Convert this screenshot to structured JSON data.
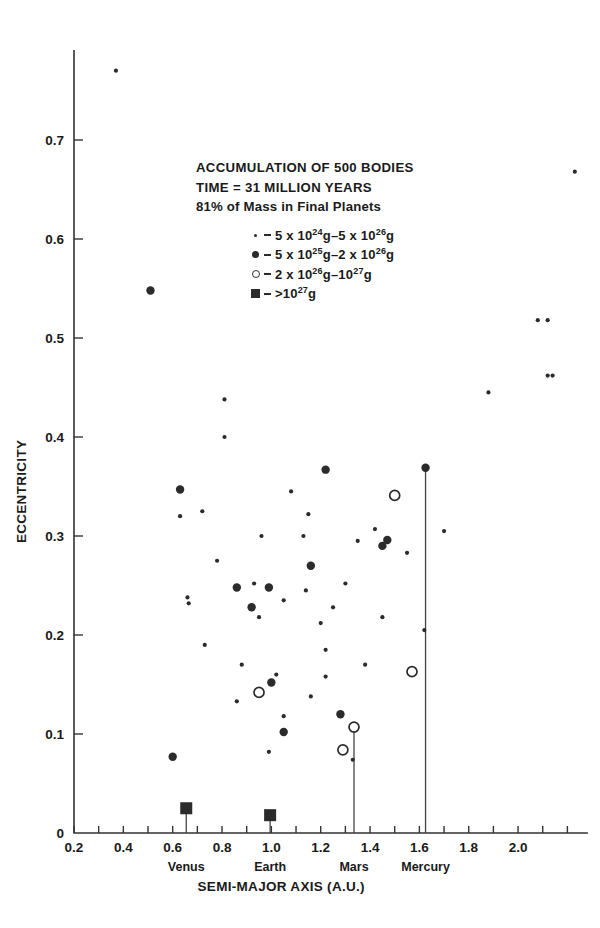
{
  "figure": {
    "annotation": {
      "line1": "ACCUMULATION OF 500 BODIES",
      "line2": "TIME = 31 MILLION YEARS",
      "line3": "81% of Mass in Final Planets"
    },
    "legend": [
      {
        "marker": "tiny-dot",
        "prefix": "5 x 10",
        "exp1": "24",
        "mid": "g–5 x 10",
        "exp2": "26",
        "suffix": "g",
        "text": "5 x 10^24 g–5 x 10^26 g"
      },
      {
        "marker": "dot",
        "prefix": "5 x 10",
        "exp1": "25",
        "mid": "g–2 x 10",
        "exp2": "26",
        "suffix": "g",
        "text": "5 x 10^25 g–2 x 10^26 g"
      },
      {
        "marker": "open-circle",
        "prefix": "2 x 10",
        "exp1": "26",
        "mid": "g–10",
        "exp2": "27",
        "suffix": "g",
        "text": "2 x 10^26 g–10^27 g"
      },
      {
        "marker": "filled-square",
        "prefix": ">10",
        "exp1": "27",
        "mid": "",
        "exp2": "",
        "suffix": "g",
        "text": ">10^27 g"
      }
    ]
  },
  "chart_data": {
    "type": "scatter",
    "title": "ACCUMULATION OF 500 BODIES",
    "xlabel": "SEMI-MAJOR AXIS (A.U.)",
    "ylabel": "ECCENTRICITY",
    "xlim": [
      0.2,
      2.28
    ],
    "ylim": [
      0.0,
      0.79
    ],
    "xticks": [
      0.2,
      0.3,
      0.4,
      0.5,
      0.6,
      0.7,
      0.8,
      0.9,
      1.0,
      1.1,
      1.2,
      1.3,
      1.4,
      1.5,
      1.6,
      1.7,
      1.8,
      1.9,
      2.0,
      2.1,
      2.2
    ],
    "xticklabels": [
      "0.2",
      "",
      "0.4",
      "",
      "0.6",
      "",
      "0.8",
      "",
      "1.0",
      "",
      "1.2",
      "",
      "1.4",
      "",
      "1.6",
      "",
      "1.8",
      "",
      "2.0",
      "",
      ""
    ],
    "yticks": [
      0.0,
      0.1,
      0.2,
      0.3,
      0.4,
      0.5,
      0.6,
      0.7
    ],
    "yticklabels": [
      "0",
      "0.1",
      "0.2",
      "0.3",
      "0.4",
      "0.5",
      "0.6",
      "0.7"
    ],
    "grid": false,
    "legend_position": "upper-center",
    "planet_markers": [
      {
        "name": "Venus",
        "a": 0.655,
        "e": 0.025
      },
      {
        "name": "Earth",
        "a": 0.995,
        "e": 0.018
      },
      {
        "name": "Mars",
        "a": 1.335,
        "e": 0.107
      },
      {
        "name": "Mercury",
        "a": 1.625,
        "e": 0.369
      }
    ],
    "series": [
      {
        "name": "5 x 10^24 g–5 x 10^26 g",
        "marker": "tiny-dot",
        "points": [
          [
            0.37,
            0.77
          ],
          [
            0.63,
            0.32
          ],
          [
            0.72,
            0.325
          ],
          [
            0.81,
            0.438
          ],
          [
            0.81,
            0.4
          ],
          [
            0.66,
            0.238
          ],
          [
            0.665,
            0.232
          ],
          [
            0.78,
            0.275
          ],
          [
            0.73,
            0.19
          ],
          [
            0.93,
            0.252
          ],
          [
            0.96,
            0.3
          ],
          [
            1.08,
            0.345
          ],
          [
            1.15,
            0.322
          ],
          [
            1.13,
            0.3
          ],
          [
            1.05,
            0.235
          ],
          [
            0.95,
            0.218
          ],
          [
            1.14,
            0.245
          ],
          [
            1.2,
            0.212
          ],
          [
            1.35,
            0.295
          ],
          [
            1.42,
            0.307
          ],
          [
            1.3,
            0.252
          ],
          [
            1.25,
            0.228
          ],
          [
            1.22,
            0.185
          ],
          [
            1.02,
            0.16
          ],
          [
            1.05,
            0.118
          ],
          [
            0.86,
            0.133
          ],
          [
            0.88,
            0.17
          ],
          [
            1.16,
            0.138
          ],
          [
            1.55,
            0.283
          ],
          [
            1.7,
            0.305
          ],
          [
            1.62,
            0.205
          ],
          [
            1.88,
            0.445
          ],
          [
            2.08,
            0.518
          ],
          [
            2.12,
            0.518
          ],
          [
            2.12,
            0.462
          ],
          [
            2.14,
            0.462
          ],
          [
            2.23,
            0.668
          ],
          [
            1.33,
            0.074
          ],
          [
            1.22,
            0.158
          ],
          [
            0.99,
            0.082
          ],
          [
            1.45,
            0.218
          ],
          [
            1.38,
            0.17
          ]
        ]
      },
      {
        "name": "5 x 10^25 g–2 x 10^26 g",
        "marker": "dot",
        "points": [
          [
            0.51,
            0.548
          ],
          [
            0.63,
            0.347
          ],
          [
            0.86,
            0.248
          ],
          [
            1.22,
            0.367
          ],
          [
            1.16,
            0.27
          ],
          [
            0.99,
            0.248
          ],
          [
            1.0,
            0.152
          ],
          [
            1.05,
            0.102
          ],
          [
            1.45,
            0.29
          ],
          [
            1.47,
            0.296
          ],
          [
            1.28,
            0.12
          ],
          [
            0.6,
            0.077
          ],
          [
            1.625,
            0.369
          ],
          [
            0.92,
            0.228
          ]
        ]
      },
      {
        "name": "2 x 10^26 g–10^27 g",
        "marker": "open-circle",
        "points": [
          [
            1.5,
            0.341
          ],
          [
            1.57,
            0.163
          ],
          [
            0.95,
            0.142
          ],
          [
            1.29,
            0.084
          ],
          [
            1.335,
            0.107
          ]
        ]
      },
      {
        "name": ">10^27 g",
        "marker": "filled-square",
        "points": [
          [
            0.655,
            0.025
          ],
          [
            0.995,
            0.018
          ]
        ]
      }
    ]
  }
}
